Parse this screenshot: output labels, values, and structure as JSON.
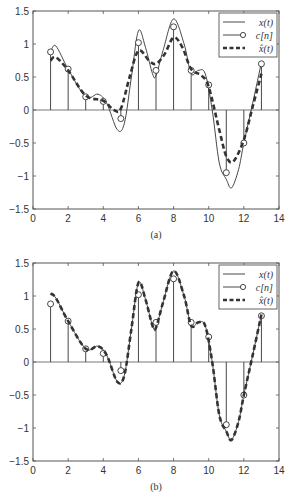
{
  "chart_data": [
    {
      "type": "line",
      "panel": "a",
      "caption": "(a)",
      "xlim": [
        0,
        14
      ],
      "ylim": [
        -1.5,
        1.5
      ],
      "xticks": [
        0,
        2,
        4,
        6,
        8,
        10,
        12,
        14
      ],
      "yticks": [
        -1.5,
        -1,
        -0.5,
        0,
        0.5,
        1,
        1.5
      ],
      "xtick_labels": [
        "0",
        "2",
        "4",
        "6",
        "8",
        "10",
        "12",
        "14"
      ],
      "ytick_labels": [
        "-1.5",
        "-1",
        "-0.5",
        "0",
        "0.5",
        "1",
        "1.5"
      ],
      "grid": false,
      "legend_position": "upper right",
      "legend": [
        "x(t)",
        "c[n]",
        "x̂(t)"
      ],
      "series": [
        {
          "name": "x(t)",
          "style": "solid",
          "x": [
            1,
            1.3,
            2,
            3,
            3.7,
            4.2,
            4.8,
            5.2,
            5.6,
            6,
            6.4,
            6.8,
            7,
            7.4,
            8,
            8.6,
            9,
            9.4,
            9.8,
            10.2,
            10.6,
            11,
            11.3,
            11.7,
            12,
            12.5,
            13
          ],
          "values": [
            0.88,
            0.97,
            0.62,
            0.2,
            0.24,
            0.1,
            -0.3,
            -0.2,
            0.5,
            1.2,
            0.95,
            0.55,
            0.52,
            0.9,
            1.38,
            1.0,
            0.55,
            0.6,
            0.55,
            0.0,
            -0.8,
            -1.05,
            -1.18,
            -0.9,
            -0.5,
            0.1,
            0.72
          ]
        },
        {
          "name": "c[n]",
          "style": "stem",
          "x": [
            1,
            2,
            3,
            4,
            5,
            6,
            7,
            8,
            9,
            10,
            11,
            12,
            13
          ],
          "values": [
            0.88,
            0.62,
            0.2,
            0.13,
            -0.13,
            1.02,
            0.6,
            1.26,
            0.6,
            0.38,
            -0.95,
            -0.5,
            0.7
          ]
        },
        {
          "name": "x̂(t)",
          "style": "dashed",
          "x": [
            1,
            1.3,
            2,
            3,
            4,
            4.6,
            5,
            5.5,
            6,
            6.6,
            7,
            7.5,
            8,
            8.5,
            9,
            9.6,
            10,
            10.6,
            11,
            11.4,
            12,
            12.5,
            13
          ],
          "values": [
            0.75,
            0.8,
            0.6,
            0.22,
            0.14,
            0.0,
            0.02,
            0.5,
            0.9,
            0.75,
            0.7,
            0.85,
            1.1,
            0.95,
            0.62,
            0.52,
            0.35,
            -0.3,
            -0.7,
            -0.78,
            -0.45,
            0.05,
            0.55
          ]
        }
      ]
    },
    {
      "type": "line",
      "panel": "b",
      "caption": "(b)",
      "xlim": [
        0,
        14
      ],
      "ylim": [
        -1.5,
        1.5
      ],
      "xticks": [
        0,
        2,
        4,
        6,
        8,
        10,
        12,
        14
      ],
      "yticks": [
        -1.5,
        -1,
        -0.5,
        0,
        0.5,
        1,
        1.5
      ],
      "xtick_labels": [
        "0",
        "2",
        "4",
        "6",
        "8",
        "10",
        "12",
        "14"
      ],
      "ytick_labels": [
        "-1.5",
        "-1",
        "-0.5",
        "0",
        "0.5",
        "1",
        "1.5"
      ],
      "grid": false,
      "legend_position": "upper right",
      "legend": [
        "x(t)",
        "c[n]",
        "x̂(t)"
      ],
      "series": [
        {
          "name": "x(t)",
          "style": "solid",
          "x": [
            1,
            1.3,
            2,
            3,
            3.7,
            4.2,
            4.8,
            5.2,
            5.6,
            6,
            6.4,
            6.8,
            7,
            7.4,
            8,
            8.6,
            9,
            9.4,
            9.8,
            10.2,
            10.6,
            11,
            11.3,
            11.7,
            12,
            12.5,
            13
          ],
          "values": [
            1.02,
            0.97,
            0.62,
            0.2,
            0.24,
            0.1,
            -0.3,
            -0.2,
            0.5,
            1.2,
            0.95,
            0.55,
            0.52,
            0.9,
            1.38,
            1.0,
            0.55,
            0.6,
            0.55,
            0.0,
            -0.8,
            -1.05,
            -1.18,
            -0.9,
            -0.5,
            0.1,
            0.72
          ]
        },
        {
          "name": "c[n]",
          "style": "stem",
          "x": [
            1,
            2,
            3,
            4,
            5,
            6,
            7,
            8,
            9,
            10,
            11,
            12,
            13
          ],
          "values": [
            0.88,
            0.62,
            0.2,
            0.13,
            -0.13,
            1.02,
            0.6,
            1.26,
            0.6,
            0.38,
            -0.95,
            -0.5,
            0.7
          ]
        },
        {
          "name": "x̂(t)",
          "style": "dashed",
          "x": [
            1,
            1.3,
            2,
            3,
            3.7,
            4.2,
            4.8,
            5.2,
            5.6,
            6,
            6.4,
            6.8,
            7,
            7.4,
            8,
            8.6,
            9,
            9.4,
            9.8,
            10.2,
            10.6,
            11,
            11.3,
            11.7,
            12,
            12.5,
            13
          ],
          "values": [
            1.04,
            0.97,
            0.62,
            0.2,
            0.24,
            0.1,
            -0.3,
            -0.2,
            0.5,
            1.2,
            0.95,
            0.55,
            0.52,
            0.9,
            1.38,
            1.0,
            0.55,
            0.6,
            0.55,
            0.0,
            -0.8,
            -1.05,
            -1.18,
            -0.9,
            -0.5,
            0.1,
            0.72
          ]
        }
      ]
    }
  ],
  "figure": {
    "panels": [
      {
        "id": "a",
        "caption": "(a)"
      },
      {
        "id": "b",
        "caption": "(b)"
      }
    ],
    "legend_labels": {
      "x": "x(t)",
      "c": "c[n]",
      "xhat": "x̂(t)"
    },
    "colors": {
      "line": "#333333",
      "axis": "#555555",
      "background": "#ffffff"
    }
  }
}
